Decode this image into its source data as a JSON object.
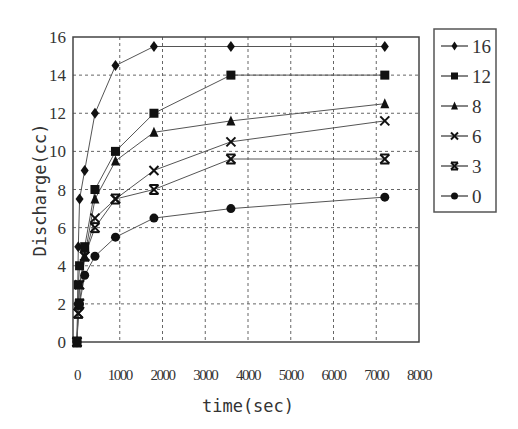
{
  "chart_data": {
    "type": "line",
    "title": "",
    "xlabel": "time(sec)",
    "ylabel": "Discharge(cc)",
    "xlim": [
      0,
      8000
    ],
    "ylim": [
      0,
      16
    ],
    "xticks": [
      0,
      1000,
      2000,
      3000,
      4000,
      5000,
      6000,
      7000,
      8000
    ],
    "xtick_labels": [
      "0",
      "1000",
      "2000",
      "3000",
      "4000",
      "5000",
      "6000",
      "7000",
      "8000"
    ],
    "yticks": [
      0,
      2,
      4,
      6,
      8,
      10,
      12,
      14,
      16
    ],
    "ytick_labels": [
      "0",
      "2",
      "4",
      "6",
      "8",
      "10",
      "12",
      "14",
      "16"
    ],
    "grid": true,
    "legend_position": "right",
    "x": [
      0,
      30,
      60,
      180,
      420,
      900,
      1800,
      3600,
      7200
    ],
    "series": [
      {
        "name": "16",
        "marker": "diamond",
        "values": [
          0,
          5.0,
          7.5,
          9.0,
          12.0,
          14.5,
          15.5,
          15.5,
          15.5
        ]
      },
      {
        "name": "12",
        "marker": "square",
        "values": [
          0,
          3.0,
          4.0,
          5.0,
          8.0,
          10.0,
          12.0,
          14.0,
          14.0
        ]
      },
      {
        "name": "8",
        "marker": "triangle",
        "values": [
          0,
          2.0,
          3.0,
          4.5,
          7.5,
          9.5,
          11.0,
          11.6,
          12.5
        ]
      },
      {
        "name": "6",
        "marker": "x",
        "values": [
          0,
          1.5,
          3.0,
          4.5,
          6.5,
          7.5,
          9.0,
          10.5,
          11.6
        ]
      },
      {
        "name": "3",
        "marker": "star",
        "values": [
          0,
          1.5,
          2.0,
          4.5,
          6.0,
          7.5,
          8.0,
          9.6,
          9.6
        ]
      },
      {
        "name": "0",
        "marker": "circle",
        "values": [
          0,
          2.0,
          2.0,
          3.5,
          4.5,
          5.5,
          6.5,
          7.0,
          7.6
        ]
      }
    ]
  }
}
